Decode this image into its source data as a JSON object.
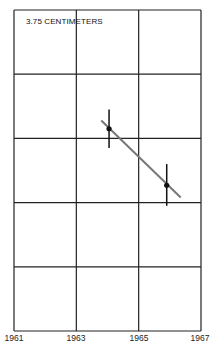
{
  "chart_data": {
    "type": "scatter",
    "title": "3.75 CENTIMETERS",
    "xlabel": "",
    "ylabel": "",
    "x_ticks": [
      "1961",
      "1963",
      "1965",
      "1967"
    ],
    "xlim": [
      1961,
      1967
    ],
    "ylim": [
      0,
      5
    ],
    "y_gridlines": 5,
    "grid": true,
    "legend": null,
    "series": [
      {
        "name": "measurements",
        "points": [
          {
            "x": 1964.05,
            "y": 3.15,
            "err_low": 2.85,
            "err_high": 3.45
          },
          {
            "x": 1965.9,
            "y": 2.27,
            "err_low": 1.95,
            "err_high": 2.6
          }
        ]
      }
    ],
    "trend_line": {
      "x": [
        1963.8,
        1966.35
      ],
      "y": [
        3.28,
        2.08
      ]
    }
  },
  "colors": {
    "grid": "#222222",
    "points": "#111111",
    "trend": "#777777"
  }
}
